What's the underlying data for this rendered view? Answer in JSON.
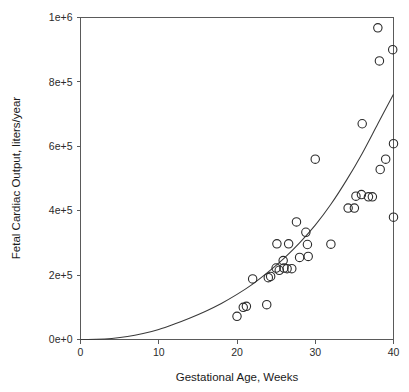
{
  "chart_data": {
    "type": "scatter",
    "title": "",
    "xlabel": "Gestational Age, Weeks",
    "ylabel": "Fetal Cardiac Output, liters/year",
    "xlim": [
      0,
      40
    ],
    "ylim": [
      0,
      1000000
    ],
    "xticks": [
      0,
      10,
      20,
      30,
      40
    ],
    "xticklabels": [
      "0",
      "10",
      "20",
      "30",
      "40"
    ],
    "yticks": [
      0,
      200000,
      400000,
      600000,
      800000,
      1000000
    ],
    "yticklabels": [
      "0e+0",
      "2e+5",
      "4e+5",
      "6e+5",
      "8e+5",
      "1e+6"
    ],
    "grid": false,
    "legend": null,
    "series": [
      {
        "name": "Fetal cardiac output observations",
        "marker": "open-circle",
        "color": "#2b2b2b",
        "points": [
          {
            "x": 20.0,
            "y": 72000
          },
          {
            "x": 20.8,
            "y": 100000
          },
          {
            "x": 21.2,
            "y": 103000
          },
          {
            "x": 22.0,
            "y": 188000
          },
          {
            "x": 23.8,
            "y": 108000
          },
          {
            "x": 24.0,
            "y": 192000
          },
          {
            "x": 24.3,
            "y": 196000
          },
          {
            "x": 25.0,
            "y": 222000
          },
          {
            "x": 25.1,
            "y": 297000
          },
          {
            "x": 25.4,
            "y": 215000
          },
          {
            "x": 25.9,
            "y": 245000
          },
          {
            "x": 26.0,
            "y": 222000
          },
          {
            "x": 26.4,
            "y": 220000
          },
          {
            "x": 26.6,
            "y": 297000
          },
          {
            "x": 27.0,
            "y": 220000
          },
          {
            "x": 27.6,
            "y": 365000
          },
          {
            "x": 28.0,
            "y": 255000
          },
          {
            "x": 28.8,
            "y": 333000
          },
          {
            "x": 29.0,
            "y": 295000
          },
          {
            "x": 29.1,
            "y": 258000
          },
          {
            "x": 30.0,
            "y": 560000
          },
          {
            "x": 32.0,
            "y": 296000
          },
          {
            "x": 34.2,
            "y": 408000
          },
          {
            "x": 35.0,
            "y": 408000
          },
          {
            "x": 35.2,
            "y": 445000
          },
          {
            "x": 35.9,
            "y": 450000
          },
          {
            "x": 36.0,
            "y": 670000
          },
          {
            "x": 36.8,
            "y": 443000
          },
          {
            "x": 37.3,
            "y": 443000
          },
          {
            "x": 38.0,
            "y": 968000
          },
          {
            "x": 38.2,
            "y": 865000
          },
          {
            "x": 38.3,
            "y": 528000
          },
          {
            "x": 39.0,
            "y": 560000
          },
          {
            "x": 39.9,
            "y": 900000
          },
          {
            "x": 40.0,
            "y": 608000
          },
          {
            "x": 40.0,
            "y": 380000
          }
        ]
      }
    ],
    "fit_curve": {
      "name": "Regression fit",
      "type": "power",
      "color": "#3a3a3a",
      "x": [
        0,
        2,
        4,
        6,
        8,
        10,
        12,
        14,
        16,
        18,
        20,
        22,
        24,
        26,
        28,
        30,
        32,
        34,
        36,
        38,
        40
      ],
      "y": [
        0,
        500,
        3200,
        9000,
        18500,
        31000,
        48000,
        67000,
        88000,
        112000,
        140000,
        172000,
        210000,
        252000,
        300000,
        355000,
        420000,
        495000,
        578000,
        670000,
        762000
      ]
    }
  },
  "figure": {
    "background_color": "#ffffff",
    "axis_color": "#5a5a5a",
    "marker_color": "#2b2b2b",
    "curve_color": "#3a3a3a"
  }
}
